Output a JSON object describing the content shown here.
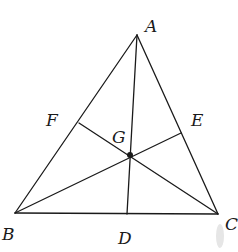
{
  "figure": {
    "type": "geometry",
    "colors": {
      "stroke": "#1a1a1a",
      "background": "#ffffff",
      "smudge": "#e6e6e6"
    },
    "points": {
      "A": {
        "label": "A",
        "x": 137,
        "y": 35
      },
      "B": {
        "label": "B",
        "x": 15,
        "y": 213
      },
      "C": {
        "label": "C",
        "x": 218,
        "y": 214
      },
      "D": {
        "label": "D",
        "x": 127,
        "y": 214
      },
      "E": {
        "label": "E",
        "x": 181,
        "y": 133
      },
      "F": {
        "label": "F",
        "x": 79,
        "y": 123
      },
      "G": {
        "label": "G",
        "x": 130,
        "y": 155
      }
    },
    "labels": {
      "A": {
        "text": "A",
        "x": 145,
        "y": 32
      },
      "B": {
        "text": "B",
        "x": 2,
        "y": 240
      },
      "C": {
        "text": "C",
        "x": 225,
        "y": 230
      },
      "D": {
        "text": "D",
        "x": 118,
        "y": 244
      },
      "E": {
        "text": "E",
        "x": 191,
        "y": 126
      },
      "F": {
        "text": "F",
        "x": 46,
        "y": 126
      },
      "G": {
        "text": "G",
        "x": 112,
        "y": 143
      }
    },
    "segments": [
      {
        "name": "side-ab",
        "from": "A",
        "to": "B"
      },
      {
        "name": "side-bc",
        "from": "B",
        "to": "C"
      },
      {
        "name": "side-ca",
        "from": "C",
        "to": "A"
      },
      {
        "name": "median-ad",
        "from": "A",
        "to": "D"
      },
      {
        "name": "median-be",
        "from": "B",
        "to": "E"
      },
      {
        "name": "median-cf",
        "from": "C",
        "to": "F"
      }
    ],
    "centroid_dot": {
      "point": "G",
      "radius": 3
    }
  }
}
